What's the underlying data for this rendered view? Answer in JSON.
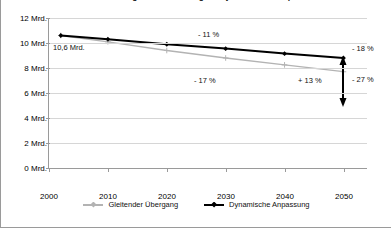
{
  "chart_data": {
    "type": "line",
    "title": "Entwicklung der Rentenausgaben je nach Reformpfad",
    "xlabel": "",
    "ylabel": "",
    "x": [
      2002,
      2010,
      2020,
      2030,
      2040,
      2050
    ],
    "xticks": [
      "2000",
      "2010",
      "2020",
      "2030",
      "2040",
      "2050"
    ],
    "xlim": [
      2000,
      2054
    ],
    "yticks": [
      "0 Mrd.",
      "2 Mrd.",
      "4 Mrd.",
      "6 Mrd.",
      "8 Mrd.",
      "10 Mrd.",
      "12 Mrd."
    ],
    "ytickvalues": [
      0,
      2,
      4,
      6,
      8,
      10,
      12
    ],
    "ylim": [
      0,
      12
    ],
    "grid": true,
    "legend_position": "bottom",
    "series": [
      {
        "name": "Gleitender Übergang",
        "color": "#b3b3b3",
        "marker": "plus",
        "values": [
          10.6,
          10.1,
          9.4,
          8.8,
          8.25,
          7.7
        ]
      },
      {
        "name": "Dynamische Anpassung",
        "color": "#000000",
        "marker": "diamond",
        "values": [
          10.6,
          10.3,
          9.9,
          9.55,
          9.15,
          8.8
        ]
      }
    ],
    "annotations": [
      {
        "text": "10,6 Mrd.",
        "name": "start-value-label"
      },
      {
        "text": "- 11 %",
        "name": "black-series-change-label"
      },
      {
        "text": "- 17 %",
        "name": "gray-series-change-label"
      },
      {
        "text": "+ 13 %",
        "name": "gap-change-label"
      },
      {
        "text": "- 18 %",
        "name": "black-endpoint-change-label"
      },
      {
        "text": "- 27 %",
        "name": "gray-endpoint-change-label"
      }
    ]
  },
  "colors": {
    "axis": "#9a9a9a",
    "grid": "#d6d6d6",
    "series_gray": "#b3b3b3",
    "series_black": "#000000",
    "background": "#ffffff"
  }
}
